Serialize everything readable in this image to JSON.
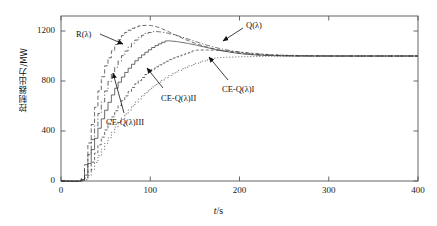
{
  "figure": {
    "background": "#ffffff",
    "axis_color": "#555555",
    "curve_color": "#3a3a3a"
  },
  "axes": {
    "x": {
      "label": "t/s",
      "label_italic_part": "t",
      "label_rest": "/s",
      "ticks": [
        0,
        100,
        200,
        300,
        400
      ],
      "tick_labels": [
        "0",
        "100",
        "200",
        "300",
        "400"
      ],
      "range": [
        0,
        400
      ]
    },
    "y": {
      "label": "控制器出力/MW",
      "ticks": [
        0,
        400,
        800,
        1200
      ],
      "tick_labels": [
        "0",
        "400",
        "800",
        "1200"
      ],
      "range": [
        0,
        1320
      ]
    }
  },
  "annotations": [
    {
      "name": "r-lambda",
      "text": "R(λ)",
      "x": 76,
      "y": 29,
      "arrow": [
        [
          100,
          34
        ],
        [
          123,
          44
        ]
      ]
    },
    {
      "name": "q-lambda",
      "text": "Q(λ)",
      "x": 246,
      "y": 20,
      "arrow": [
        [
          243,
          28
        ],
        [
          223,
          41
        ]
      ]
    },
    {
      "name": "ce-q-lambda-1",
      "text": "CE-Q(λ)I",
      "x": 222,
      "y": 84,
      "arrow": [
        [
          228,
          80
        ],
        [
          209,
          57
        ]
      ]
    },
    {
      "name": "ce-q-lambda-2",
      "text": "CE-Q(λ)II",
      "x": 161,
      "y": 93,
      "arrow": [
        [
          163,
          88
        ],
        [
          147,
          68
        ]
      ]
    },
    {
      "name": "ce-q-lambda-3",
      "text": "CE-Q(λ)III",
      "x": 106,
      "y": 117,
      "arrow": [
        [
          124,
          113
        ],
        [
          113,
          73
        ]
      ]
    }
  ],
  "chart_data": {
    "type": "line",
    "title": "",
    "xlabel": "t/s",
    "ylabel": "控制器出力/MW",
    "xlim": [
      0,
      400
    ],
    "ylim": [
      0,
      1320
    ],
    "grid": false,
    "legend": "inline-annotations",
    "x_ticks": [
      0,
      100,
      200,
      300,
      400
    ],
    "y_ticks": [
      0,
      400,
      800,
      1200
    ],
    "step_style": "staircase rise then smooth decay",
    "settling_value": 1000,
    "series": [
      {
        "name": "R(λ)",
        "linestyle": "dashed",
        "peak": {
          "t": 97,
          "value": 1245
        },
        "x": [
          0,
          20,
          24,
          27,
          30,
          33,
          36,
          39,
          42,
          45,
          48,
          52,
          56,
          60,
          65,
          70,
          75,
          80,
          85,
          90,
          97,
          105,
          115,
          125,
          140,
          155,
          170,
          185,
          200,
          215,
          230,
          245,
          270,
          300,
          340,
          400
        ],
        "y": [
          0,
          0,
          40,
          160,
          300,
          420,
          530,
          640,
          740,
          830,
          905,
          975,
          1035,
          1090,
          1140,
          1180,
          1205,
          1225,
          1238,
          1244,
          1245,
          1238,
          1212,
          1178,
          1130,
          1090,
          1060,
          1038,
          1022,
          1012,
          1006,
          1003,
          1001,
          1000,
          1000,
          1000
        ]
      },
      {
        "name": "Q(λ)",
        "linestyle": "dashdot",
        "peak": {
          "t": 104,
          "value": 1195
        },
        "x": [
          0,
          20,
          24,
          28,
          32,
          36,
          40,
          44,
          48,
          52,
          57,
          62,
          67,
          72,
          78,
          84,
          90,
          96,
          104,
          112,
          122,
          134,
          148,
          162,
          178,
          194,
          210,
          226,
          244,
          265,
          295,
          340,
          400
        ],
        "y": [
          0,
          0,
          30,
          140,
          275,
          395,
          505,
          605,
          700,
          785,
          865,
          935,
          995,
          1045,
          1095,
          1135,
          1165,
          1185,
          1195,
          1192,
          1178,
          1155,
          1122,
          1090,
          1060,
          1038,
          1022,
          1012,
          1005,
          1001,
          1000,
          1000,
          1000
        ]
      },
      {
        "name": "CE-Q(λ)III",
        "linestyle": "solid",
        "peak": {
          "t": 117,
          "value": 1120
        },
        "x": [
          0,
          20,
          25,
          29,
          33,
          38,
          43,
          48,
          53,
          58,
          63,
          69,
          75,
          81,
          88,
          95,
          102,
          110,
          117,
          126,
          136,
          148,
          162,
          176,
          192,
          208,
          224,
          242,
          262,
          288,
          320,
          360,
          400
        ],
        "y": [
          0,
          0,
          25,
          110,
          230,
          350,
          455,
          550,
          635,
          712,
          780,
          845,
          900,
          950,
          995,
          1035,
          1070,
          1100,
          1120,
          1118,
          1108,
          1092,
          1070,
          1048,
          1028,
          1014,
          1006,
          1002,
          1000,
          1000,
          1000,
          1000,
          1000
        ]
      },
      {
        "name": "CE-Q(λ)II",
        "linestyle": "dashed-fine",
        "peak": {
          "t": 150,
          "value": 1045
        },
        "x": [
          0,
          20,
          26,
          31,
          36,
          42,
          48,
          54,
          60,
          67,
          74,
          81,
          89,
          97,
          105,
          114,
          123,
          133,
          143,
          150,
          162,
          175,
          190,
          205,
          220,
          238,
          258,
          282,
          312,
          350,
          400
        ],
        "y": [
          0,
          0,
          20,
          95,
          195,
          300,
          395,
          480,
          560,
          635,
          705,
          765,
          820,
          870,
          912,
          948,
          980,
          1005,
          1028,
          1045,
          1048,
          1045,
          1038,
          1028,
          1018,
          1010,
          1005,
          1002,
          1000,
          1000,
          1000
        ]
      },
      {
        "name": "CE-Q(λ)I",
        "linestyle": "dotted",
        "peak": {
          "t": 170,
          "value": 985
        },
        "x": [
          0,
          20,
          27,
          33,
          39,
          46,
          53,
          60,
          68,
          76,
          84,
          93,
          102,
          112,
          122,
          133,
          144,
          156,
          168,
          180,
          194,
          208,
          224,
          242,
          262,
          288,
          320,
          360,
          400
        ],
        "y": [
          0,
          0,
          15,
          80,
          170,
          265,
          350,
          430,
          505,
          575,
          640,
          700,
          755,
          805,
          850,
          890,
          925,
          955,
          978,
          988,
          992,
          995,
          997,
          999,
          1000,
          1000,
          1000,
          1000,
          1000
        ]
      }
    ]
  }
}
